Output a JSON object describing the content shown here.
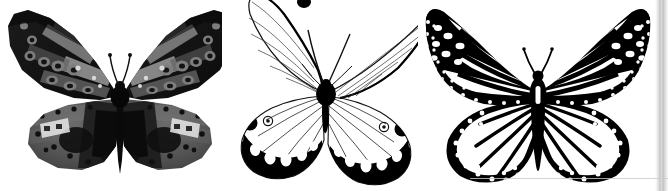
{
  "plate": {
    "title": "Butterfly specimen comparison plate",
    "background_color": "#ffffff",
    "width": 668,
    "height": 191,
    "panel_count": 3,
    "caption": "",
    "has_visible_text": false
  },
  "palette": {
    "ink_black": "#000000",
    "near_black": "#0d0d0d",
    "dark_charcoal": "#1a1a1a",
    "wing_dark_gray": "#3a3a3a",
    "wing_mid_gray": "#565656",
    "wing_light_gray": "#8f8f8f",
    "wing_pale_gray": "#b9b9b9",
    "highlight_white": "#f2f2f2",
    "paper_white": "#ffffff",
    "edge_strip_gray": "#bdbdbd"
  },
  "figures": [
    {
      "id": "figure-1",
      "name": "grayscale-photograph-butterfly",
      "rendering": "grayscale photograph of a pinned specimen",
      "position": "left",
      "wing_posture": "wings spread flat, dorsal view",
      "forewing": {
        "ground_color": "#141414",
        "markings": "pale gray elongated cells and streaks, ringed ocelli with dark centers",
        "ocelli_count": 9,
        "shape": "elongate triangular, rounded apex, clipped near image top edge"
      },
      "hindwing": {
        "ground_color": "#5a5a5a",
        "markings": "rows of round dark submarginal spots, light gray bands, small white flecks",
        "spot_rows": 2,
        "shape": "broad rounded fan"
      },
      "body": {
        "thorax": "solid black, rounded",
        "abdomen": "long, slender, tapering downward",
        "antennae": 2,
        "antenna_style": "thin with slight club at tip"
      }
    },
    {
      "id": "figure-2",
      "name": "line-drawing-glasswing-butterfly",
      "rendering": "black ink line drawing, translucent wings",
      "position": "center",
      "wing_posture": "wings spread, forewings swept upward, left forewing tip clipped at top edge",
      "forewing": {
        "ground_color": "#ffffff",
        "outline_color": "#000000",
        "markings": "fine vein lines only, transparent membrane, thin dark costal edge",
        "shape": "long narrow blade, pointed apex"
      },
      "hindwing": {
        "ground_color": "#ffffff",
        "markings": "bold black marginal band filled with rounded white spots; two ringed eyespots with white pupils near anal angle",
        "eyespot_count": 2,
        "white_spots_in_band": 5,
        "shape": "rounded lobe"
      },
      "body": {
        "thorax": "solid black blot",
        "abdomen": "short black taper",
        "antennae": 2,
        "antenna_style": "long thin curved filaments"
      }
    },
    {
      "id": "figure-3",
      "name": "monarch-butterfly-illustration",
      "rendering": "high-contrast black and white illustration",
      "position": "right",
      "wing_posture": "wings fully spread, dorsal view",
      "forewing": {
        "ground_color": "#ffffff",
        "vein_color": "#000000",
        "markings": "heavy black veins and apex field, double row of white marginal dots, white apical spots",
        "shape": "triangular with slightly falcate apex"
      },
      "hindwing": {
        "ground_color": "#ffffff",
        "markings": "thick black margin with two rows of white dots, radiating black veins",
        "spot_rows": 2,
        "shape": "rounded, scalloped margin"
      },
      "body": {
        "thorax": "black with elongated white slit marking",
        "abdomen": "black, tapering, banded",
        "antennae": 2,
        "antenna_style": "thin, slightly clubbed"
      }
    }
  ],
  "artifacts": {
    "right_edge_strip": "vertical gray scan-edge band at far right",
    "bottom_edge_line": "faint horizontal gray rule near bottom right"
  }
}
